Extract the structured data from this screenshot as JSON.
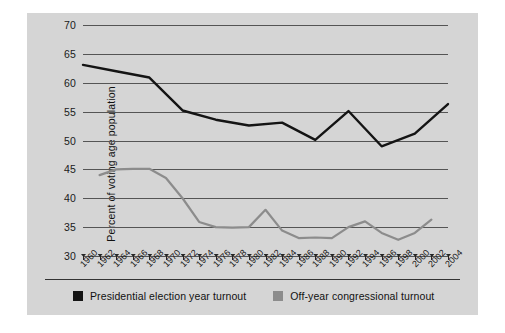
{
  "chart_data": {
    "type": "line",
    "title": "",
    "xlabel": "",
    "ylabel": "Percent of voting age population",
    "ylim": [
      30,
      70
    ],
    "ytick_values": [
      70,
      65,
      60,
      55,
      50,
      45,
      40,
      35,
      30
    ],
    "ytick_labels": [
      "70",
      "65",
      "60",
      "55",
      "50",
      "45",
      "40",
      "35",
      "30"
    ],
    "grid": true,
    "legend_position": "bottom",
    "categories": [
      "1960",
      "1962",
      "1964",
      "1966",
      "1968",
      "1970",
      "1972",
      "1974",
      "1976",
      "1978",
      "1980",
      "1982",
      "1984",
      "1986",
      "1988",
      "1990",
      "1992",
      "1994",
      "1996",
      "1998",
      "2000",
      "2002",
      "2004"
    ],
    "series": [
      {
        "name": "Presidential election year turnout",
        "color": "#141414",
        "values": [
          63.1,
          null,
          62.0,
          null,
          60.9,
          null,
          55.2,
          null,
          53.6,
          null,
          52.6,
          null,
          53.1,
          null,
          50.1,
          null,
          55.1,
          null,
          49.0,
          null,
          51.2,
          null,
          56.3
        ]
      },
      {
        "name": "Off-year congressional turnout",
        "color": "#8c8c8c",
        "values": [
          null,
          44.0,
          45.0,
          45.1,
          45.1,
          43.5,
          40.0,
          35.9,
          35.0,
          34.9,
          35.0,
          38.0,
          34.4,
          33.1,
          33.2,
          33.1,
          35.0,
          36.0,
          34.0,
          32.8,
          34.0,
          36.3,
          null
        ]
      }
    ]
  },
  "legend": {
    "items": [
      {
        "label": "Presidential election year turnout",
        "color": "#141414"
      },
      {
        "label": "Off-year congressional turnout",
        "color": "#8c8c8c"
      }
    ]
  }
}
